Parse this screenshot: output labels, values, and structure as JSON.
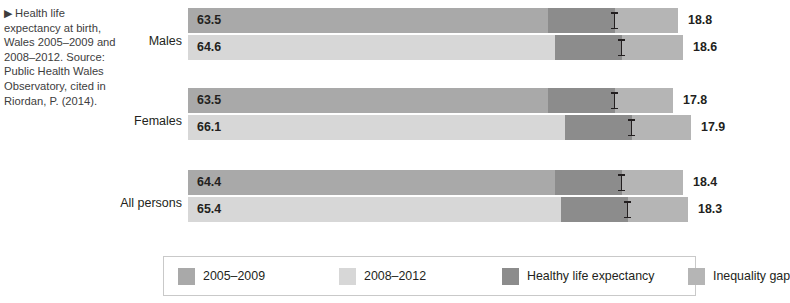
{
  "caption": {
    "marker": "▶",
    "text": "Health life expectancy at birth, Wales 2005–2009 and 2008–2012. Source: Public Health Wales Observatory, cited in Riordan, P. (2014)."
  },
  "colors": {
    "series_2005_2009": "#a9a9a9",
    "series_2008_2012": "#d7d7d7",
    "healthy_life_expectancy": "#8c8c8c",
    "inequality_gap": "#b5b5b5",
    "text": "#231f20",
    "legend_border": "#c9c9c9",
    "background": "#ffffff"
  },
  "legend": {
    "items": [
      {
        "label": "2005–2009",
        "color": "#a9a9a9",
        "swatch": "legend-swatch-2005-2009"
      },
      {
        "label": "2008–2012",
        "color": "#d7d7d7",
        "swatch": "legend-swatch-2008-2012"
      },
      {
        "label": "Healthy life expectancy",
        "color": "#8c8c8c",
        "swatch": "legend-swatch-healthy"
      },
      {
        "label": "Inequality gap",
        "color": "#b5b5b5",
        "swatch": "legend-swatch-gap"
      }
    ]
  },
  "chart_data": {
    "type": "bar",
    "title": "Health life expectancy at birth, Wales 2005–2009 and 2008–2012",
    "orientation": "horizontal",
    "stacked": true,
    "xlabel": "",
    "ylabel": "",
    "grid": false,
    "legend_position": "bottom",
    "categories": [
      "Males",
      "Females",
      "All persons"
    ],
    "series": [
      {
        "name": "2005–2009",
        "color": "#a9a9a9",
        "healthy_life_expectancy": [
          63.5,
          63.5,
          64.4
        ],
        "inequality_gap": [
          18.8,
          17.8,
          18.4
        ]
      },
      {
        "name": "2008–2012",
        "color": "#d7d7d7",
        "healthy_life_expectancy": [
          64.6,
          66.1,
          65.4
        ],
        "inequality_gap": [
          18.6,
          17.9,
          18.3
        ]
      }
    ],
    "annotations": [
      {
        "label": "H",
        "meaning": "healthy life expectancy marker"
      }
    ]
  },
  "groups": [
    {
      "label": "Males",
      "bars": [
        {
          "series": "2005–2009",
          "value": "63.5",
          "gap": "18.8",
          "color": "#a9a9a9",
          "bar_width": 427,
          "healthy_left": 360,
          "healthy_width": 67,
          "gap_left": 360,
          "gap_width": 130,
          "marker_left": 423
        },
        {
          "series": "2008–2012",
          "value": "64.6",
          "gap": "18.6",
          "color": "#d7d7d7",
          "bar_width": 434,
          "healthy_left": 367,
          "healthy_width": 67,
          "gap_left": 367,
          "gap_width": 128,
          "marker_left": 430
        }
      ]
    },
    {
      "label": "Females",
      "bars": [
        {
          "series": "2005–2009",
          "value": "63.5",
          "gap": "17.8",
          "color": "#a9a9a9",
          "bar_width": 427,
          "healthy_left": 360,
          "healthy_width": 67,
          "gap_left": 360,
          "gap_width": 125,
          "marker_left": 423
        },
        {
          "series": "2008–2012",
          "value": "66.1",
          "gap": "17.9",
          "color": "#d7d7d7",
          "bar_width": 444,
          "healthy_left": 377,
          "healthy_width": 67,
          "gap_left": 377,
          "gap_width": 126,
          "marker_left": 440
        }
      ]
    },
    {
      "label": "All persons",
      "bars": [
        {
          "series": "2005–2009",
          "value": "64.4",
          "gap": "18.4",
          "color": "#a9a9a9",
          "bar_width": 434,
          "healthy_left": 367,
          "healthy_width": 67,
          "gap_left": 367,
          "gap_width": 128,
          "marker_left": 430
        },
        {
          "series": "2008–2012",
          "value": "65.4",
          "gap": "18.3",
          "color": "#d7d7d7",
          "bar_width": 440,
          "healthy_left": 373,
          "healthy_width": 67,
          "gap_left": 373,
          "gap_width": 127,
          "marker_left": 436
        }
      ]
    }
  ]
}
